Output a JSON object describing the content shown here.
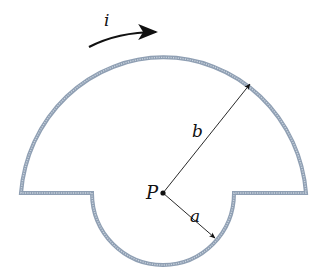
{
  "diagram": {
    "colors": {
      "wire": "#8f9fb3",
      "wire_inner": "#c9d3de",
      "ink": "#111111",
      "background": "#ffffff"
    },
    "labels": {
      "current": "i",
      "center": "P",
      "large_radius": "b",
      "small_radius": "a"
    }
  }
}
